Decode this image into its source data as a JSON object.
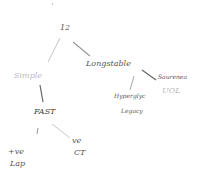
{
  "diagram": {
    "type": "handwritten-tree",
    "nodes": [
      {
        "id": "root",
        "label": "12",
        "x": 60,
        "y": 25
      },
      {
        "id": "simple",
        "label": "Simple",
        "x": 14,
        "y": 73,
        "parent": "root"
      },
      {
        "id": "longstable",
        "label": "Longstable",
        "x": 85,
        "y": 61,
        "parent": "root"
      },
      {
        "id": "fast",
        "label": "FAST",
        "x": 34,
        "y": 108,
        "parent": "simple"
      },
      {
        "id": "pos-lap",
        "label": "+ve",
        "label2": "Lap",
        "x": 8,
        "y": 150,
        "parent": "fast"
      },
      {
        "id": "neg-ct",
        "label": "ve",
        "label2": "CT",
        "x": 72,
        "y": 138,
        "parent": "fast"
      },
      {
        "id": "hyperglyc",
        "label": "Hyperglyc",
        "label2": "Legacy",
        "x": 113,
        "y": 93,
        "parent": "longstable"
      },
      {
        "id": "saurenea",
        "label": "Saurenea",
        "label2": "UOL",
        "x": 156,
        "y": 74,
        "parent": "longstable"
      }
    ],
    "edge_color": "#9a9a9a"
  }
}
